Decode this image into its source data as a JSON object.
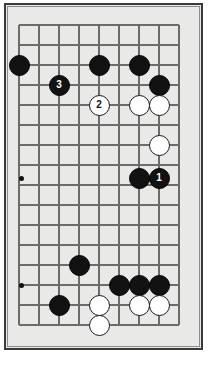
{
  "figure": {
    "kind": "go-board-diagram",
    "board_background_color": "#e9e9e7",
    "frame_color": "#3a3a3a",
    "line_color": "#6b6b6b",
    "black_stone_color": "#121212",
    "white_stone_color": "#ffffff",
    "columns": 9,
    "rows": 17,
    "grid_origin_x": 19,
    "grid_origin_y": 25,
    "grid_step": 20
  },
  "grid": {
    "vertical_lines_x": [
      19,
      39,
      59,
      79,
      99,
      119,
      139,
      159,
      179
    ],
    "horizontal_lines_y": [
      25,
      45,
      65,
      85,
      105,
      125,
      145,
      165,
      178,
      198,
      218,
      238,
      258,
      265,
      285,
      305,
      325,
      341
    ]
  },
  "star_points": [
    {
      "name": "star-point-left-upper",
      "x": 21,
      "y": 178
    },
    {
      "name": "star-point-left-lower",
      "x": 21,
      "y": 285
    }
  ],
  "stones": [
    {
      "id": "b-a",
      "color": "black",
      "x": 19,
      "y": 65,
      "label": ""
    },
    {
      "id": "b-b",
      "color": "black",
      "x": 99,
      "y": 65,
      "label": ""
    },
    {
      "id": "b-c",
      "color": "black",
      "x": 139,
      "y": 65,
      "label": ""
    },
    {
      "id": "b-3",
      "color": "black",
      "x": 59,
      "y": 85,
      "label": "3"
    },
    {
      "id": "b-d",
      "color": "black",
      "x": 159,
      "y": 85,
      "label": ""
    },
    {
      "id": "w-2",
      "color": "white",
      "x": 99,
      "y": 105,
      "label": "2"
    },
    {
      "id": "w-a",
      "color": "white",
      "x": 139,
      "y": 105,
      "label": ""
    },
    {
      "id": "w-b",
      "color": "white",
      "x": 159,
      "y": 105,
      "label": ""
    },
    {
      "id": "w-c",
      "color": "white",
      "x": 159,
      "y": 145,
      "label": ""
    },
    {
      "id": "b-e",
      "color": "black",
      "x": 139,
      "y": 178,
      "label": ""
    },
    {
      "id": "b-1",
      "color": "black",
      "x": 159,
      "y": 178,
      "label": "1"
    },
    {
      "id": "b-f",
      "color": "black",
      "x": 79,
      "y": 265,
      "label": ""
    },
    {
      "id": "b-g",
      "color": "black",
      "x": 119,
      "y": 285,
      "label": ""
    },
    {
      "id": "b-h",
      "color": "black",
      "x": 139,
      "y": 285,
      "label": ""
    },
    {
      "id": "b-i",
      "color": "black",
      "x": 159,
      "y": 285,
      "label": ""
    },
    {
      "id": "b-j",
      "color": "black",
      "x": 59,
      "y": 305,
      "label": ""
    },
    {
      "id": "w-d",
      "color": "white",
      "x": 99,
      "y": 305,
      "label": ""
    },
    {
      "id": "w-e",
      "color": "white",
      "x": 139,
      "y": 305,
      "label": ""
    },
    {
      "id": "w-f",
      "color": "white",
      "x": 159,
      "y": 305,
      "label": ""
    },
    {
      "id": "w-g",
      "color": "white",
      "x": 99,
      "y": 325,
      "label": ""
    }
  ],
  "move_labels": {
    "move_1": "1",
    "move_2": "2",
    "move_3": "3"
  }
}
